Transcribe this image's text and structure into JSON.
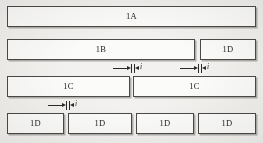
{
  "figure": {
    "background_color": "#f2f1ef",
    "block_fill_color": "#fbfbfa",
    "block_border_color": "#4a4a48",
    "text_color": "#1d1d1b",
    "rows": [
      {
        "name": "row-1a",
        "blocks": [
          {
            "label": "1A",
            "x": 7,
            "y": 6,
            "w": 249,
            "h": 21
          }
        ]
      },
      {
        "name": "row-1b-1d",
        "blocks": [
          {
            "label": "1B",
            "x": 7,
            "y": 39,
            "w": 188,
            "h": 21
          },
          {
            "label": "1D",
            "x": 200,
            "y": 39,
            "w": 56,
            "h": 21
          }
        ]
      },
      {
        "name": "row-1c-1c",
        "blocks": [
          {
            "label": "1C",
            "x": 7,
            "y": 76,
            "w": 123,
            "h": 21
          },
          {
            "label": "1C",
            "x": 133,
            "y": 76,
            "w": 123,
            "h": 21
          }
        ]
      },
      {
        "name": "row-1d-x4",
        "blocks": [
          {
            "label": "1D",
            "x": 7,
            "y": 113,
            "w": 57,
            "h": 21
          },
          {
            "label": "1D",
            "x": 68,
            "y": 113,
            "w": 64,
            "h": 21
          },
          {
            "label": "1D",
            "x": 136,
            "y": 113,
            "w": 58,
            "h": 21
          },
          {
            "label": "1D",
            "x": 198,
            "y": 113,
            "w": 58,
            "h": 21
          }
        ]
      }
    ],
    "dimensions": [
      {
        "name": "gap-dimension-1c-1c",
        "label": "i",
        "x": 113,
        "y": 64,
        "w": 40,
        "gap_left": 18,
        "gap_right": 22,
        "label_x": 27
      },
      {
        "name": "gap-dimension-1b-1d",
        "label": "i",
        "x": 180,
        "y": 64,
        "w": 40,
        "gap_left": 18,
        "gap_right": 22,
        "label_x": 27
      },
      {
        "name": "gap-dimension-1d-1d",
        "label": "i",
        "x": 48,
        "y": 101,
        "w": 40,
        "gap_left": 18,
        "gap_right": 22,
        "label_x": 27
      }
    ]
  }
}
